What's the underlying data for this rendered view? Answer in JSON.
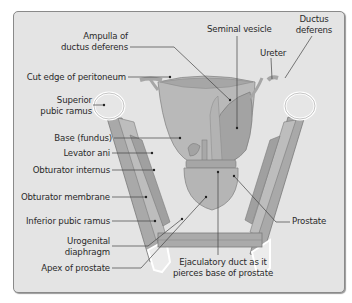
{
  "diagram": {
    "colors": {
      "background": "#e4e4e4",
      "frame_border": "#8a8a8a",
      "bladder": "#b9b9b9",
      "prostate": "#b5b5b5",
      "seminal_vesicle": "#a3a3a3",
      "muscle": "#a9a9a9",
      "bone_outline": "#ffffff",
      "leader_line": "#444444",
      "text": "#2a2a2a"
    },
    "labels": {
      "ampulla": [
        "Ampulla of",
        "ductus deferens"
      ],
      "cut_edge": "Cut edge of peritoneum",
      "superior_ramus": [
        "Superior",
        "pubic ramus"
      ],
      "base_fundus": "Base (fundus)",
      "levator_ani": "Levator ani",
      "obturator_internus": "Obturator internus",
      "obturator_membrane": "Obturator membrane",
      "inferior_ramus": "Inferior pubic ramus",
      "urogenital": [
        "Urogenital",
        "diaphragm"
      ],
      "apex": "Apex of prostate",
      "seminal_vesicle": "Seminal vesicle",
      "ureter": "Ureter",
      "ductus_deferens": [
        "Ductus",
        "deferens"
      ],
      "prostate": "Prostate",
      "ejaculatory": [
        "Ejaculatory duct as it",
        "pierces base of prostate"
      ]
    }
  }
}
